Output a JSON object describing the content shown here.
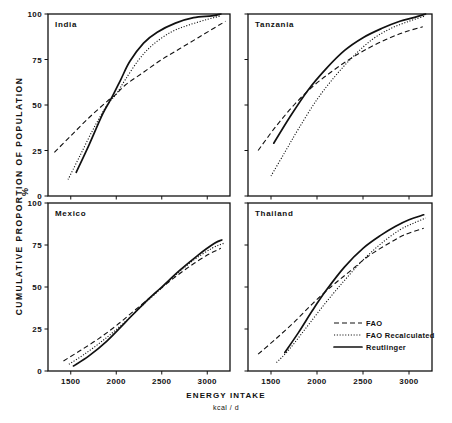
{
  "figure": {
    "y_axis_label": "CUMULATIVE  PROPORTION  OF  POPULATION",
    "y_axis_unit": "%",
    "x_axis_label": "ENERGY   INTAKE",
    "x_axis_unit": "kcal / d"
  },
  "legend": {
    "items": [
      {
        "label": "FAO",
        "style": "dashed"
      },
      {
        "label": "FAO Recalculated",
        "style": "dotted"
      },
      {
        "label": "Reutlinger",
        "style": "solid"
      }
    ]
  },
  "chart_data": {
    "type": "line",
    "title": "",
    "xlabel": "ENERGY INTAKE (kcal / d)",
    "ylabel": "CUMULATIVE PROPORTION OF POPULATION (%)",
    "xlim": [
      1250,
      3250
    ],
    "ylim": [
      0,
      100
    ],
    "xticks": [
      1500,
      2000,
      2500,
      3000
    ],
    "yticks": [
      0,
      25,
      50,
      75,
      100
    ],
    "grid": false,
    "legend_position": "inside bottom-right of Thailand panel",
    "series_styles": {
      "FAO": "dashed",
      "FAO Recalculated": "dotted",
      "Reutlinger": "solid"
    },
    "panels": [
      {
        "name": "India",
        "position": "top-left",
        "series": [
          {
            "name": "FAO",
            "x": [
              1320,
              1500,
              1700,
              1900,
              2000,
              2100,
              2300,
              2500,
              2700,
              2900,
              3100,
              3200
            ],
            "y": [
              24,
              33,
              43,
              52,
              56,
              61,
              68,
              75,
              81,
              87,
              93,
              96
            ]
          },
          {
            "name": "FAO Recalculated",
            "x": [
              1470,
              1600,
              1750,
              1900,
              2000,
              2100,
              2250,
              2400,
              2600,
              2800,
              3000,
              3150
            ],
            "y": [
              9,
              22,
              37,
              50,
              56,
              64,
              75,
              83,
              90,
              94,
              97,
              99
            ]
          },
          {
            "name": "Reutlinger",
            "x": [
              1560,
              1700,
              1850,
              1950,
              2050,
              2150,
              2300,
              2450,
              2650,
              2850,
              3050,
              3150
            ],
            "y": [
              13,
              28,
              45,
              54,
              64,
              74,
              84,
              90,
              95,
              98,
              99,
              100
            ]
          }
        ]
      },
      {
        "name": "Tanzania",
        "position": "top-right",
        "series": [
          {
            "name": "FAO",
            "x": [
              1360,
              1550,
              1750,
              1950,
              2150,
              2350,
              2550,
              2750,
              2950,
              3150
            ],
            "y": [
              25,
              38,
              50,
              60,
              68,
              75,
              81,
              86,
              90,
              93
            ]
          },
          {
            "name": "FAO Recalculated",
            "x": [
              1500,
              1650,
              1800,
              2000,
              2200,
              2400,
              2600,
              2800,
              3000,
              3180
            ],
            "y": [
              11,
              24,
              37,
              53,
              66,
              77,
              86,
              92,
              96,
              99
            ]
          },
          {
            "name": "Reutlinger",
            "x": [
              1530,
              1700,
              1900,
              2100,
              2300,
              2500,
              2700,
              2900,
              3050,
              3180
            ],
            "y": [
              29,
              43,
              58,
              70,
              80,
              87,
              92,
              96,
              98,
              100
            ]
          }
        ]
      },
      {
        "name": "Mexico",
        "position": "bottom-left",
        "series": [
          {
            "name": "FAO",
            "x": [
              1420,
              1600,
              1800,
              2000,
              2200,
              2400,
              2600,
              2800,
              3000,
              3150
            ],
            "y": [
              6,
              12,
              19,
              27,
              36,
              45,
              54,
              62,
              69,
              73
            ]
          },
          {
            "name": "FAO Recalculated",
            "x": [
              1480,
              1650,
              1850,
              2050,
              2250,
              2450,
              2650,
              2850,
              3050,
              3180
            ],
            "y": [
              4,
              10,
              18,
              27,
              37,
              47,
              57,
              66,
              73,
              76
            ]
          },
          {
            "name": "Reutlinger",
            "x": [
              1530,
              1700,
              1900,
              2100,
              2300,
              2500,
              2700,
              2900,
              3080,
              3160
            ],
            "y": [
              3,
              9,
              18,
              29,
              40,
              50,
              60,
              69,
              76,
              78
            ]
          }
        ]
      },
      {
        "name": "Thailand",
        "position": "bottom-right",
        "series": [
          {
            "name": "FAO",
            "x": [
              1360,
              1550,
              1750,
              1950,
              2150,
              2350,
              2550,
              2750,
              2950,
              3160
            ],
            "y": [
              10,
              19,
              29,
              40,
              50,
              59,
              68,
              75,
              81,
              85
            ]
          },
          {
            "name": "FAO Recalculated",
            "x": [
              1560,
              1700,
              1900,
              2100,
              2300,
              2500,
              2700,
              2900,
              3050,
              3180
            ],
            "y": [
              5,
              13,
              27,
              41,
              54,
              66,
              76,
              84,
              88,
              91
            ]
          },
          {
            "name": "Reutlinger",
            "x": [
              1650,
              1800,
              1950,
              2100,
              2300,
              2500,
              2700,
              2850,
              3000,
              3160
            ],
            "y": [
              11,
              23,
              36,
              48,
              62,
              73,
              81,
              86,
              90,
              93
            ]
          }
        ]
      }
    ]
  }
}
